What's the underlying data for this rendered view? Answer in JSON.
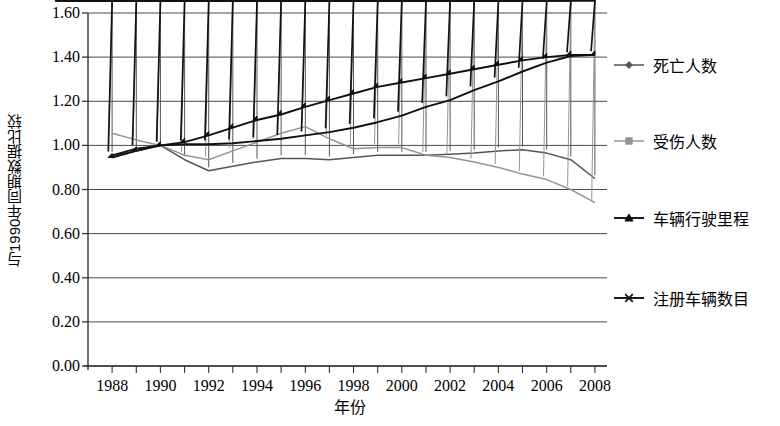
{
  "chart_data": {
    "type": "line",
    "title": "",
    "xlabel": "年份",
    "ylabel": "与1990年同期数据比较",
    "xlim": [
      1987,
      2008.5
    ],
    "ylim": [
      0.0,
      1.6
    ],
    "ytick_labels": [
      "1.60",
      "1.40",
      "1.20",
      "1.00",
      "0.80",
      "0.60",
      "0.40",
      "0.20",
      "0.00"
    ],
    "ytick_values": [
      1.6,
      1.4,
      1.2,
      1.0,
      0.8,
      0.6,
      0.4,
      0.2,
      0.0
    ],
    "xtick_labels": [
      "1988",
      "1990",
      "1992",
      "1994",
      "1996",
      "1998",
      "2000",
      "2002",
      "2004",
      "2006",
      "2008"
    ],
    "xtick_values": [
      1988,
      1990,
      1992,
      1994,
      1996,
      1998,
      2000,
      2002,
      2004,
      2006,
      2008
    ],
    "grid": true,
    "grid_axis": "y",
    "legend_position": "right",
    "x": [
      1988,
      1989,
      1990,
      1991,
      1992,
      1993,
      1994,
      1995,
      1996,
      1997,
      1998,
      1999,
      2000,
      2001,
      2002,
      2003,
      2004,
      2005,
      2006,
      2007,
      2008
    ],
    "series": [
      {
        "name": "死亡人数",
        "marker": "diamond",
        "color": "#555555",
        "values": [
          0.955,
          0.975,
          1.0,
          0.935,
          0.885,
          0.905,
          0.925,
          0.94,
          0.94,
          0.935,
          0.945,
          0.955,
          0.955,
          0.955,
          0.96,
          0.965,
          0.975,
          0.98,
          0.965,
          0.935,
          0.85
        ]
      },
      {
        "name": "受伤人数",
        "marker": "square",
        "color": "#949494",
        "values": [
          1.055,
          1.025,
          1.0,
          0.955,
          0.935,
          0.975,
          1.015,
          1.055,
          1.085,
          1.03,
          0.985,
          0.99,
          0.99,
          0.955,
          0.945,
          0.925,
          0.9,
          0.87,
          0.845,
          0.8,
          0.74
        ]
      },
      {
        "name": "车辆行驶里程",
        "marker": "triangle",
        "color": "#111111",
        "values": [
          0.945,
          0.975,
          1.0,
          1.015,
          1.045,
          1.08,
          1.115,
          1.14,
          1.175,
          1.205,
          1.235,
          1.265,
          1.285,
          1.305,
          1.325,
          1.345,
          1.365,
          1.385,
          1.4,
          1.41,
          1.41
        ]
      },
      {
        "name": "注册车辆数目",
        "marker": "cross",
        "color": "#111111",
        "values": [
          0.955,
          0.985,
          1.0,
          1.005,
          1.005,
          1.01,
          1.02,
          1.03,
          1.045,
          1.06,
          1.08,
          1.105,
          1.135,
          1.175,
          1.205,
          1.25,
          1.29,
          1.335,
          1.375,
          1.405,
          1.41
        ]
      }
    ]
  },
  "legend": {
    "items": [
      {
        "label": "死亡人数"
      },
      {
        "label": "受伤人数"
      },
      {
        "label": "车辆行驶里程"
      },
      {
        "label": "注册车辆数目"
      }
    ]
  }
}
